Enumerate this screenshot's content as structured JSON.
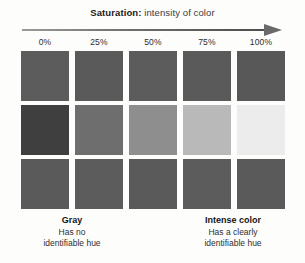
{
  "figure": {
    "title_strong": "Saturation:",
    "title_rest": " intensity of color",
    "arrow_name": "right-arrow-icon"
  },
  "chart_data": {
    "type": "heatmap",
    "title": "Saturation: intensity of color",
    "xlabel": "",
    "ylabel": "",
    "categories": [
      "0%",
      "25%",
      "50%",
      "75%",
      "100%"
    ],
    "grid": false,
    "legend_position": "none",
    "series": [
      {
        "name": "row-1",
        "values": [
          "#5c5c5c",
          "#5a5a5a",
          "#5c5c5c",
          "#5a5a5a",
          "#585858"
        ]
      },
      {
        "name": "row-2",
        "values": [
          "#3f3f3f",
          "#6e6e6e",
          "#8e8e8e",
          "#b9b9b9",
          "#ececec"
        ]
      },
      {
        "name": "row-3",
        "values": [
          "#5a5a5a",
          "#5c5c5c",
          "#5a5a5a",
          "#5c5c5c",
          "#5a5a5a"
        ]
      }
    ],
    "annotations": [
      "Gray — Has no identifiable hue",
      "Intense color — Has a clearly identifiable hue"
    ]
  },
  "columns": [
    {
      "label": "0%"
    },
    {
      "label": "25%"
    },
    {
      "label": "50%"
    },
    {
      "label": "75%"
    },
    {
      "label": "100%"
    }
  ],
  "captions": {
    "left": {
      "title": "Gray",
      "line1": "Has no",
      "line2": "identifiable hue"
    },
    "right": {
      "title": "Intense color",
      "line1": "Has a clearly",
      "line2": "identifiable hue"
    }
  }
}
